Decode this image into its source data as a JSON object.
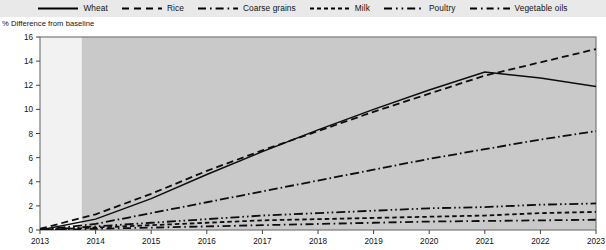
{
  "legend": {
    "items": [
      {
        "label": "Wheat",
        "icon": "solid-line-icon",
        "style": "solid",
        "color": "#000000"
      },
      {
        "label": "Rice",
        "icon": "dashed-line-icon",
        "style": "dashed",
        "color": "#000000"
      },
      {
        "label": "Coarse grains",
        "icon": "dash-dot-line-icon",
        "style": "dashdot",
        "color": "#000000"
      },
      {
        "label": "Milk",
        "icon": "short-dashed-line-icon",
        "style": "shortdash",
        "color": "#000000"
      },
      {
        "label": "Poultry",
        "icon": "dash-dot-dot-line-icon",
        "style": "dashdotdot",
        "color": "#000000"
      },
      {
        "label": "Vegetable oils",
        "icon": "dash-dot-line-icon",
        "style": "longdashdot",
        "color": "#000000"
      }
    ]
  },
  "axis_title": "% Difference from baseline",
  "chart_data": {
    "type": "line",
    "title": "",
    "subtitle": "",
    "xlabel": "",
    "ylabel": "% Difference from baseline",
    "xlim": [
      2013,
      2023
    ],
    "ylim": [
      0,
      16
    ],
    "ytick_step": 2,
    "yticks": [
      0,
      2,
      4,
      6,
      8,
      10,
      12,
      14,
      16
    ],
    "xticks": [
      2013,
      2014,
      2015,
      2016,
      2017,
      2018,
      2019,
      2020,
      2021,
      2022,
      2023
    ],
    "x": [
      2013,
      2014,
      2015,
      2016,
      2017,
      2018,
      2019,
      2020,
      2021,
      2022,
      2023
    ],
    "grid": false,
    "legend_position": "top",
    "shaded_projection_start": 2013.75,
    "plot_bg_historical": "#f2f2f2",
    "plot_bg_projection": "#c9c9c9",
    "series": [
      {
        "name": "Wheat",
        "style": "solid",
        "values": [
          0.0,
          0.9,
          2.6,
          4.6,
          6.5,
          8.3,
          10.0,
          11.6,
          13.1,
          12.6,
          11.9
        ]
      },
      {
        "name": "Rice",
        "style": "dashed",
        "values": [
          0.1,
          1.3,
          3.0,
          4.9,
          6.6,
          8.2,
          9.8,
          11.3,
          12.8,
          13.9,
          15.0
        ]
      },
      {
        "name": "Coarse grains",
        "style": "dashdot",
        "values": [
          0.0,
          0.5,
          1.4,
          2.3,
          3.2,
          4.1,
          5.0,
          5.9,
          6.7,
          7.5,
          8.2
        ]
      },
      {
        "name": "Milk",
        "style": "shortdash",
        "values": [
          0.0,
          0.2,
          0.4,
          0.6,
          0.8,
          0.9,
          1.0,
          1.1,
          1.2,
          1.4,
          1.5
        ]
      },
      {
        "name": "Poultry",
        "style": "dashdotdot",
        "values": [
          0.0,
          0.3,
          0.6,
          0.9,
          1.2,
          1.4,
          1.6,
          1.8,
          1.9,
          2.1,
          2.2
        ]
      },
      {
        "name": "Vegetable oils",
        "style": "longdashdot",
        "values": [
          0.0,
          0.1,
          0.2,
          0.3,
          0.4,
          0.5,
          0.6,
          0.7,
          0.75,
          0.8,
          0.85
        ]
      }
    ]
  }
}
